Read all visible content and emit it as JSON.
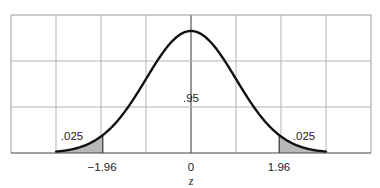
{
  "chart_data": {
    "type": "area",
    "title": "",
    "xlabel": "z",
    "ylabel": "",
    "distribution": "standard normal",
    "xlim": [
      -4,
      4
    ],
    "ylim": [
      0,
      0.4
    ],
    "grid": true,
    "grid_columns": 8,
    "grid_rows": 3,
    "x_ticks": [
      {
        "value": -1.96,
        "label": "−1.96"
      },
      {
        "value": 0,
        "label": "0"
      },
      {
        "value": 1.96,
        "label": "1.96"
      }
    ],
    "curve_range": [
      -3,
      3
    ],
    "regions": [
      {
        "name": "left tail",
        "from": -3,
        "to": -1.96,
        "area": 0.025,
        "label": ".025",
        "shaded": true
      },
      {
        "name": "center",
        "from": -1.96,
        "to": 1.96,
        "area": 0.95,
        "label": ".95",
        "shaded": false
      },
      {
        "name": "right tail",
        "from": 1.96,
        "to": 3,
        "area": 0.025,
        "label": ".025",
        "shaded": true
      }
    ],
    "annotations": [
      ".025",
      ".95",
      ".025"
    ]
  },
  "colors": {
    "grid": "#b4b4b4",
    "frame": "#9a9a9a",
    "curve": "#111111",
    "tail_fill": "#b8b8b8",
    "text": "#222222"
  },
  "labels": {
    "left_tail": ".025",
    "center": ".95",
    "right_tail": ".025",
    "tick_left": "−1.96",
    "tick_zero": "0",
    "tick_right": "1.96",
    "axis": "z"
  }
}
